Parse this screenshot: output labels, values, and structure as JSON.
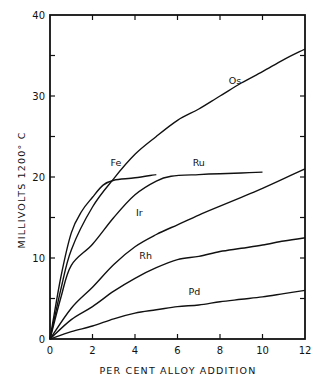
{
  "chart_data": {
    "type": "line",
    "title": "",
    "xlabel": "PER CENT ALLOY ADDITION",
    "ylabel": "MILLIVOLTS   1200° C",
    "xlim": [
      0,
      12
    ],
    "ylim": [
      0,
      40
    ],
    "x_ticks": [
      0,
      2,
      4,
      6,
      8,
      10,
      12
    ],
    "x_tick_labels": [
      "0",
      "2",
      "4",
      "6",
      "8",
      "10",
      "12"
    ],
    "y_ticks": [
      0,
      10,
      20,
      30,
      40
    ],
    "y_tick_labels": [
      "0",
      "10",
      "20",
      "30",
      "40"
    ],
    "y_minor_ticks": [
      5,
      15,
      25,
      35
    ],
    "grid": false,
    "legend": "inline labels on curves",
    "series": [
      {
        "name": "Os",
        "label_pos": [
          8.7,
          31.5
        ],
        "points": [
          [
            0,
            0
          ],
          [
            0.5,
            6.0
          ],
          [
            1,
            11.0
          ],
          [
            2,
            16.3
          ],
          [
            3,
            19.8
          ],
          [
            4,
            22.8
          ],
          [
            5,
            25.0
          ],
          [
            6,
            27.0
          ],
          [
            7,
            28.4
          ],
          [
            8,
            30.0
          ],
          [
            9,
            31.6
          ],
          [
            10,
            33.0
          ],
          [
            11,
            34.5
          ],
          [
            12,
            35.8
          ]
        ]
      },
      {
        "name": "Fe",
        "label_pos": [
          3.1,
          21.3
        ],
        "points": [
          [
            0,
            0
          ],
          [
            0.5,
            7.5
          ],
          [
            1,
            13.1
          ],
          [
            1.5,
            15.8
          ],
          [
            2,
            17.5
          ],
          [
            2.5,
            19.0
          ],
          [
            3,
            19.6
          ],
          [
            4,
            19.9
          ],
          [
            5,
            20.3
          ]
        ]
      },
      {
        "name": "Ru",
        "label_pos": [
          7.0,
          21.3
        ],
        "points": [
          [
            0,
            0
          ],
          [
            0.5,
            5.0
          ],
          [
            1,
            9.1
          ],
          [
            2,
            11.7
          ],
          [
            3,
            15.0
          ],
          [
            4,
            17.8
          ],
          [
            5,
            19.5
          ],
          [
            5.7,
            20.1
          ],
          [
            7,
            20.3
          ],
          [
            8,
            20.4
          ],
          [
            9,
            20.5
          ],
          [
            10,
            20.6
          ]
        ]
      },
      {
        "name": "Ir",
        "label_pos": [
          4.2,
          15.2
        ],
        "points": [
          [
            0,
            0
          ],
          [
            1,
            3.8
          ],
          [
            2,
            6.4
          ],
          [
            3,
            9.2
          ],
          [
            4,
            11.4
          ],
          [
            5,
            12.9
          ],
          [
            6,
            14.1
          ],
          [
            7,
            15.3
          ],
          [
            8,
            16.4
          ],
          [
            9,
            17.5
          ],
          [
            10,
            18.6
          ],
          [
            11,
            19.8
          ],
          [
            12,
            21.0
          ]
        ]
      },
      {
        "name": "Rh",
        "label_pos": [
          4.5,
          9.9
        ],
        "points": [
          [
            0,
            0
          ],
          [
            1,
            2.4
          ],
          [
            2,
            4.0
          ],
          [
            3,
            5.9
          ],
          [
            4,
            7.5
          ],
          [
            5,
            8.8
          ],
          [
            6,
            9.8
          ],
          [
            7,
            10.2
          ],
          [
            8,
            10.8
          ],
          [
            9,
            11.2
          ],
          [
            10,
            11.6
          ],
          [
            11,
            12.1
          ],
          [
            12,
            12.5
          ]
        ]
      },
      {
        "name": "Pd",
        "label_pos": [
          6.8,
          5.4
        ],
        "points": [
          [
            0,
            0
          ],
          [
            1,
            0.9
          ],
          [
            2,
            1.6
          ],
          [
            3,
            2.5
          ],
          [
            4,
            3.2
          ],
          [
            5,
            3.6
          ],
          [
            6,
            4.0
          ],
          [
            7,
            4.2
          ],
          [
            8,
            4.6
          ],
          [
            9,
            4.9
          ],
          [
            10,
            5.2
          ],
          [
            11,
            5.6
          ],
          [
            12,
            6.0
          ]
        ]
      }
    ]
  }
}
